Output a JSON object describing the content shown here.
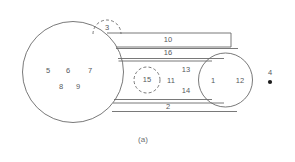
{
  "figure": {
    "caption": "(a)",
    "background_color": "#ffffff",
    "line_color": "#6a6a6a",
    "text_color": "#55595c",
    "dot_color": "#1c1c1c"
  },
  "shapes": {
    "large_circle": {
      "name": "large-left-circle",
      "cx": 73,
      "cy": 72,
      "r": 50.5,
      "style": "solid"
    },
    "small_circle": {
      "name": "small-right-circle",
      "cx": 225.5,
      "cy": 80,
      "r": 27,
      "style": "solid"
    },
    "dashed_arc_top": {
      "name": "dashed-semicircle-top",
      "cx": 107,
      "cy": 34,
      "r": 14,
      "style": "dashed"
    },
    "dashed_circle_middle": {
      "name": "dashed-circle-middle",
      "cx": 147,
      "cy": 80,
      "r": 13,
      "style": "dashed"
    },
    "point_marker": {
      "name": "filled-point-marker",
      "cx": 270,
      "cy": 82,
      "r": 2.1
    }
  },
  "labels": {
    "inside_large_circle": [
      {
        "text": "5",
        "x": 48,
        "y": 71
      },
      {
        "text": "6",
        "x": 68,
        "y": 71
      },
      {
        "text": "7",
        "x": 90,
        "y": 71
      },
      {
        "text": "8",
        "x": 61,
        "y": 87
      },
      {
        "text": "9",
        "x": 78,
        "y": 87
      }
    ],
    "bands": [
      {
        "text": "10",
        "x": 168,
        "y": 41
      },
      {
        "text": "16",
        "x": 168,
        "y": 54
      },
      {
        "text": "2",
        "x": 168,
        "y": 107
      }
    ],
    "middle_region": [
      {
        "text": "15",
        "x": 147,
        "y": 80
      },
      {
        "text": "11",
        "x": 171,
        "y": 81
      },
      {
        "text": "13",
        "x": 186,
        "y": 70
      },
      {
        "text": "14",
        "x": 186,
        "y": 91
      }
    ],
    "dashed_arc": [
      {
        "text": "3",
        "x": 107,
        "y": 28
      }
    ],
    "inside_small_circle": [
      {
        "text": "1",
        "x": 213,
        "y": 81
      },
      {
        "text": "12",
        "x": 240,
        "y": 81
      }
    ],
    "point_label": [
      {
        "text": "4",
        "x": 270,
        "y": 73
      }
    ]
  },
  "connector_lines": {
    "band_top_upper": {
      "name": "band-10-top-edge",
      "x1": 107,
      "y1": 33,
      "x2": 231,
      "y2": 33
    },
    "band_top_right": {
      "name": "band-10-right-edge",
      "x1": 231,
      "y1": 33,
      "x2": 231,
      "y2": 47
    },
    "band_top_lower": {
      "name": "band-10-bottom-edge",
      "x1": 116,
      "y1": 47,
      "x2": 231,
      "y2": 47
    },
    "band_16_upper": {
      "name": "band-16-top-edge",
      "x1": 116,
      "y1": 48,
      "x2": 237,
      "y2": 48
    },
    "band_16_lower": {
      "name": "band-16-bottom-edge",
      "x1": 119,
      "y1": 59,
      "x2": 223,
      "y2": 59
    },
    "band_16_inner": {
      "name": "band-16-inner-edge",
      "x1": 119,
      "y1": 61,
      "x2": 214,
      "y2": 61
    },
    "band_2_upper": {
      "name": "band-2-top-edge",
      "x1": 114,
      "y1": 100,
      "x2": 212,
      "y2": 100
    },
    "band_2_mid": {
      "name": "band-2-mid-edge",
      "x1": 113,
      "y1": 103,
      "x2": 222,
      "y2": 103
    },
    "band_2_lower": {
      "name": "band-2-bottom-edge",
      "x1": 112,
      "y1": 112,
      "x2": 236,
      "y2": 112
    }
  }
}
